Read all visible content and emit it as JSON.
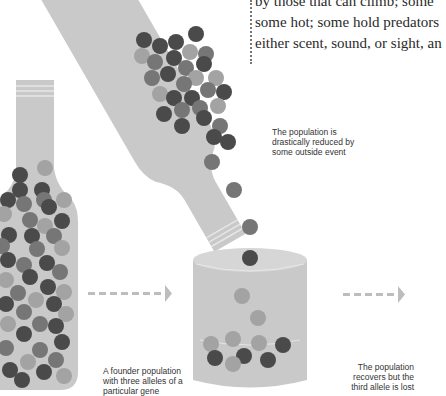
{
  "text_block": {
    "lines": [
      "by those that can climb; some",
      "some hot; some hold predators",
      "either scent, sound, or sight, an"
    ]
  },
  "captions": {
    "founder": [
      "A founder population",
      "with three alleles of a",
      "particular gene"
    ],
    "reduction": [
      "The population is",
      "drastically reduced by",
      "some outside event"
    ],
    "recovery": [
      "The population",
      "recovers but the",
      "third allele is lost"
    ]
  },
  "colors": {
    "container": "#c9c9c9",
    "allele_dark": "#4a4a4a",
    "allele_mid": "#767676",
    "allele_light": "#a3a3a3",
    "arrow": "#bdbdbd"
  },
  "stages": [
    {
      "name": "founder-population",
      "alleles": 3
    },
    {
      "name": "bottleneck-event",
      "alleles": 3
    },
    {
      "name": "recovered-population",
      "alleles": 2
    }
  ]
}
